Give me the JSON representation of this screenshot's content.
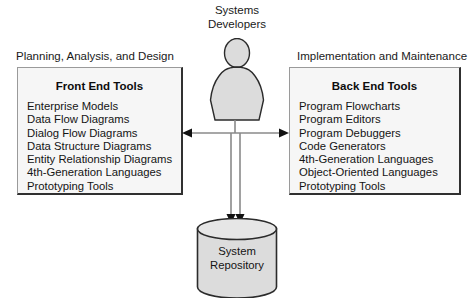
{
  "diagram": {
    "actor": {
      "label_line1": "Systems",
      "label_line2": "Developers",
      "icon": "person-silhouette-icon"
    },
    "left_section": {
      "caption": "Planning, Analysis, and Design",
      "title": "Front End Tools",
      "items": [
        "Enterprise Models",
        "Data Flow Diagrams",
        "Dialog Flow Diagrams",
        "Data Structure Diagrams",
        "Entity Relationship Diagrams",
        "4th-Generation Languages",
        "Prototyping Tools"
      ]
    },
    "right_section": {
      "caption": "Implementation and Maintenance",
      "title": "Back End Tools",
      "items": [
        "Program Flowcharts",
        "Program Editors",
        "Program Debuggers",
        "Code Generators",
        "4th-Generation Languages",
        "Object-Oriented Languages",
        "Prototyping Tools"
      ]
    },
    "repository": {
      "label_line1": "System",
      "label_line2": "Repository",
      "shape": "cylinder-database-icon"
    },
    "connectors": {
      "left_arrow": "arrow-left-icon",
      "right_arrow": "arrow-right-icon",
      "down_arrow_1": "arrow-down-icon",
      "down_arrow_2": "arrow-down-icon"
    },
    "colors": {
      "panel_fill": "#f6f6f6",
      "panel_border": "#303030",
      "shape_fill": "#dcdcdc",
      "line": "#808080",
      "arrowhead": "#111111",
      "text": "#141414"
    }
  }
}
